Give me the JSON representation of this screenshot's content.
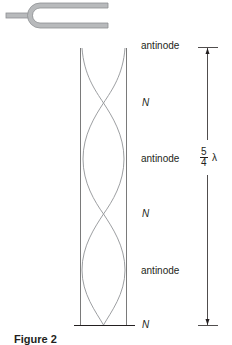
{
  "figure": {
    "caption": "Figure 2",
    "tuning_fork": {
      "icon": "tuning-fork-icon",
      "color": "#9d9fa2"
    },
    "tube": {
      "description": "closed tube with standing wave",
      "wall_color": "#7a7a7a",
      "wave_color": "#9d9fa2"
    },
    "labels": {
      "antinode_top": "antinode",
      "node_1": "N",
      "antinode_middle": "antinode",
      "node_2": "N",
      "antinode_bottom": "antinode",
      "node_bottom": "N"
    },
    "length_marker": {
      "numerator": "5",
      "denominator": "4",
      "symbol": "λ"
    }
  }
}
